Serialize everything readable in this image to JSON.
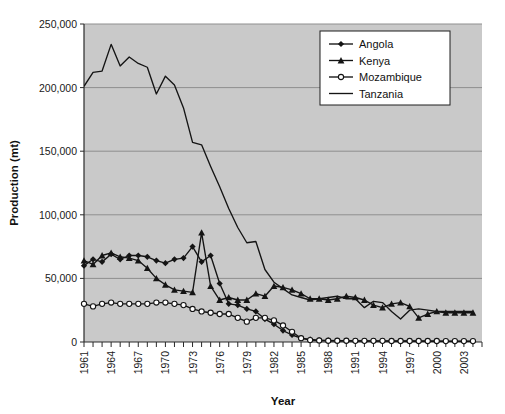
{
  "chart_data": {
    "type": "line",
    "title": "",
    "xlabel": "Year",
    "ylabel": "Production (mt)",
    "ylim": [
      0,
      250000
    ],
    "ytick_labels": [
      "0",
      "50,000",
      "100,000",
      "150,000",
      "200,000",
      "250,000"
    ],
    "ytick_values": [
      0,
      50000,
      100000,
      150000,
      200000,
      250000
    ],
    "xlim": [
      1961,
      2005
    ],
    "xtick_labels": [
      "1961",
      "1964",
      "1967",
      "1970",
      "1973",
      "1976",
      "1979",
      "1982",
      "1985",
      "1988",
      "1991",
      "1994",
      "1997",
      "2000",
      "2003"
    ],
    "xtick_values": [
      1961,
      1964,
      1967,
      1970,
      1973,
      1976,
      1979,
      1982,
      1985,
      1988,
      1991,
      1994,
      1997,
      2000,
      2003
    ],
    "grid": "horizontal",
    "legend_position": "top-right",
    "plot_background": "#c9c9c9",
    "gridline_color": "#8f8f8f",
    "series_color": "#141414",
    "x": [
      1961,
      1962,
      1963,
      1964,
      1965,
      1966,
      1967,
      1968,
      1969,
      1970,
      1971,
      1972,
      1973,
      1974,
      1975,
      1976,
      1977,
      1978,
      1979,
      1980,
      1981,
      1982,
      1983,
      1984,
      1985,
      1986,
      1987,
      1988,
      1989,
      1990,
      1991,
      1992,
      1993,
      1994,
      1995,
      1996,
      1997,
      1998,
      1999,
      2000,
      2001,
      2002,
      2003,
      2004
    ],
    "series": [
      {
        "name": "Angola",
        "marker": "filled-diamond",
        "values": [
          60000,
          65000,
          63000,
          69000,
          65000,
          68000,
          68000,
          67000,
          64000,
          62000,
          65000,
          66000,
          75000,
          63000,
          68000,
          46000,
          30000,
          29000,
          26000,
          24000,
          18000,
          14000,
          9000,
          5500,
          3000,
          2000,
          1500,
          1200,
          1000,
          900,
          800,
          800,
          700,
          700,
          700,
          600,
          600,
          600,
          500,
          500,
          500,
          500,
          500,
          500
        ]
      },
      {
        "name": "Kenya",
        "marker": "filled-triangle",
        "values": [
          64000,
          61000,
          68000,
          70000,
          67000,
          66000,
          64000,
          58000,
          50000,
          45000,
          41000,
          40000,
          39000,
          86000,
          44000,
          33000,
          35000,
          33000,
          33000,
          38000,
          36000,
          44000,
          43000,
          41000,
          38000,
          34000,
          34000,
          33000,
          34000,
          36000,
          35000,
          33000,
          29000,
          27000,
          30000,
          31000,
          28000,
          19000,
          22000,
          24000,
          23000,
          23000,
          23000,
          23000
        ]
      },
      {
        "name": "Mozambique",
        "marker": "open-circle",
        "values": [
          30000,
          28000,
          30000,
          31000,
          30000,
          30000,
          30000,
          30000,
          31000,
          31000,
          30000,
          29000,
          26000,
          24000,
          23000,
          22000,
          22000,
          19000,
          16000,
          19000,
          19000,
          17000,
          13000,
          8000,
          3000,
          1500,
          1200,
          1000,
          1000,
          1000,
          900,
          900,
          900,
          900,
          800,
          800,
          800,
          800,
          800,
          800,
          700,
          700,
          700,
          700
        ]
      },
      {
        "name": "Tanzania",
        "marker": "none",
        "values": [
          201000,
          212000,
          213000,
          234000,
          217000,
          224000,
          219000,
          216000,
          195000,
          209000,
          202000,
          184000,
          157000,
          155000,
          138000,
          122000,
          105000,
          90000,
          78000,
          79000,
          57000,
          47000,
          42000,
          37000,
          35000,
          33000,
          34000,
          35000,
          36000,
          34000,
          34000,
          27000,
          32000,
          31000,
          24000,
          18000,
          25000,
          26000,
          25000,
          24000,
          24000,
          24000,
          24000,
          24000
        ]
      }
    ]
  },
  "caption": {
    "text": ""
  }
}
